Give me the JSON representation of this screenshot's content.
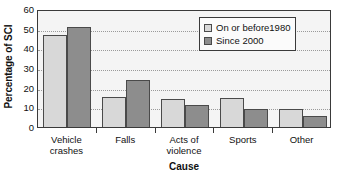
{
  "chart_data": {
    "type": "bar",
    "title": "",
    "xlabel": "Cause",
    "ylabel": "Percentage of SCI",
    "categories": [
      "Vehicle\ncrashes",
      "Falls",
      "Acts of\nviolence",
      "Sports",
      "Other"
    ],
    "series": [
      {
        "name": "On or before1980",
        "color": "#d8d8d8",
        "values": [
          47,
          15.5,
          14,
          15,
          9
        ]
      },
      {
        "name": "Since 2000",
        "color": "#8d8d8d",
        "values": [
          51,
          24,
          11,
          9,
          5.5
        ]
      }
    ],
    "ylim": [
      0,
      60
    ],
    "yticks": [
      0,
      10,
      20,
      30,
      40,
      50,
      60
    ],
    "ytick_labels": [
      "0",
      "10",
      "20",
      "30",
      "40",
      "50",
      "60"
    ],
    "grid": "horizontal-dotted",
    "legend_position": "top-right"
  },
  "legend": {
    "entries": [
      {
        "label": "On or before1980"
      },
      {
        "label": "Since 2000"
      }
    ]
  },
  "axes": {
    "y_title": "Percentage of SCI",
    "x_title": "Cause"
  },
  "colors": {
    "series_light": "#d8d8d8",
    "series_dark": "#8d8d8d",
    "frame": "#3a3a3a",
    "plot_background": "#f4f4f4",
    "gridline": "#9a9a9a"
  }
}
